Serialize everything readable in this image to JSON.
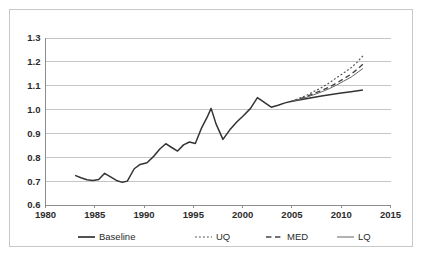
{
  "chart_data": {
    "type": "line",
    "title": "",
    "subtitle": "",
    "xlabel": "",
    "ylabel": "",
    "xlim": [
      1980,
      2015
    ],
    "ylim": [
      0.6,
      1.3
    ],
    "xticks": [
      1980,
      1985,
      1990,
      1995,
      2000,
      2005,
      2010,
      2015
    ],
    "yticks": [
      0.6,
      0.7,
      0.8,
      0.9,
      1.0,
      1.1,
      1.2,
      1.3
    ],
    "xtick_labels": [
      "1980",
      "1985",
      "1990",
      "1995",
      "2000",
      "2005",
      "2010",
      "2015"
    ],
    "ytick_labels": [
      "0.6",
      "0.7",
      "0.8",
      "0.9",
      "1.0",
      "1.1",
      "1.2",
      "1.3"
    ],
    "grid": "horizontal",
    "legend_position": "bottom",
    "series": [
      {
        "name": "Baseline",
        "style": "solid",
        "color": "#333333",
        "width": 1.5,
        "points": [
          [
            1983.0,
            0.724
          ],
          [
            1983.6,
            0.714
          ],
          [
            1984.2,
            0.706
          ],
          [
            1984.8,
            0.703
          ],
          [
            1985.4,
            0.707
          ],
          [
            1986.0,
            0.733
          ],
          [
            1986.6,
            0.718
          ],
          [
            1987.2,
            0.703
          ],
          [
            1987.8,
            0.695
          ],
          [
            1988.3,
            0.7
          ],
          [
            1989.0,
            0.752
          ],
          [
            1989.6,
            0.77
          ],
          [
            1990.3,
            0.777
          ],
          [
            1991.0,
            0.805
          ],
          [
            1991.6,
            0.835
          ],
          [
            1992.2,
            0.857
          ],
          [
            1992.8,
            0.841
          ],
          [
            1993.4,
            0.826
          ],
          [
            1994.0,
            0.852
          ],
          [
            1994.6,
            0.864
          ],
          [
            1995.2,
            0.858
          ],
          [
            1995.8,
            0.92
          ],
          [
            1996.4,
            0.968
          ],
          [
            1996.8,
            1.005
          ],
          [
            1997.3,
            0.94
          ],
          [
            1998.0,
            0.875
          ],
          [
            1998.7,
            0.915
          ],
          [
            1999.4,
            0.948
          ],
          [
            2000.1,
            0.975
          ],
          [
            2000.8,
            1.005
          ],
          [
            2001.5,
            1.05
          ],
          [
            2002.2,
            1.03
          ],
          [
            2002.9,
            1.01
          ],
          [
            2003.6,
            1.018
          ],
          [
            2004.3,
            1.028
          ],
          [
            2005.0,
            1.035
          ],
          [
            2006.0,
            1.042
          ],
          [
            2007.0,
            1.05
          ],
          [
            2008.0,
            1.057
          ],
          [
            2009.0,
            1.063
          ],
          [
            2010.0,
            1.069
          ],
          [
            2011.0,
            1.075
          ],
          [
            2012.2,
            1.082
          ]
        ]
      },
      {
        "name": "UQ",
        "style": "dotted",
        "color": "#555555",
        "width": 1.2,
        "points": [
          [
            2005.0,
            1.035
          ],
          [
            2005.8,
            1.048
          ],
          [
            2006.5,
            1.06
          ],
          [
            2007.2,
            1.075
          ],
          [
            2008.0,
            1.092
          ],
          [
            2008.8,
            1.112
          ],
          [
            2009.5,
            1.133
          ],
          [
            2010.2,
            1.152
          ],
          [
            2011.0,
            1.175
          ],
          [
            2011.6,
            1.198
          ],
          [
            2012.2,
            1.225
          ]
        ]
      },
      {
        "name": "MED",
        "style": "dashed",
        "color": "#444444",
        "width": 1.4,
        "points": [
          [
            2005.0,
            1.035
          ],
          [
            2005.8,
            1.045
          ],
          [
            2006.5,
            1.055
          ],
          [
            2007.2,
            1.067
          ],
          [
            2008.0,
            1.08
          ],
          [
            2008.8,
            1.095
          ],
          [
            2009.5,
            1.11
          ],
          [
            2010.2,
            1.128
          ],
          [
            2011.0,
            1.148
          ],
          [
            2011.6,
            1.168
          ],
          [
            2012.2,
            1.19
          ]
        ]
      },
      {
        "name": "LQ",
        "style": "solid",
        "color": "#666666",
        "width": 1.0,
        "points": [
          [
            2005.0,
            1.035
          ],
          [
            2005.8,
            1.043
          ],
          [
            2006.5,
            1.052
          ],
          [
            2007.2,
            1.062
          ],
          [
            2008.0,
            1.074
          ],
          [
            2008.8,
            1.088
          ],
          [
            2009.5,
            1.102
          ],
          [
            2010.2,
            1.118
          ],
          [
            2011.0,
            1.136
          ],
          [
            2011.6,
            1.154
          ],
          [
            2012.2,
            1.172
          ]
        ]
      }
    ],
    "legend": [
      {
        "label": "Baseline",
        "style": "solid",
        "color": "#333333",
        "width": 1.7
      },
      {
        "label": "UQ",
        "style": "dotted",
        "color": "#555555",
        "width": 1.2
      },
      {
        "label": "MED",
        "style": "dashed",
        "color": "#444444",
        "width": 1.5
      },
      {
        "label": "LQ",
        "style": "solid",
        "color": "#666666",
        "width": 1.0
      }
    ]
  },
  "colors": {
    "background": "#ffffff",
    "frame_border": "#c8c8c8",
    "gridline": "#b6b6b6",
    "axis": "#8c8c8c",
    "text": "#2b2b2b"
  }
}
